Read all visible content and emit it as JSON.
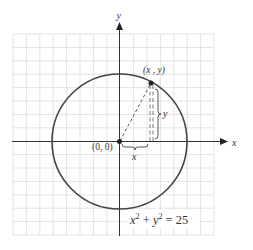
{
  "figure": {
    "axes": {
      "x_label": "x",
      "y_label": "y"
    },
    "origin_label": "(0, 0)",
    "point_label": "(x , y)",
    "horizontal_leg_label": "x",
    "vertical_leg_label": "y",
    "equation": {
      "base_x": "x",
      "exp_x": "2",
      "plus": " + ",
      "base_y": "y",
      "exp_y": "2",
      "rhs": " = 25"
    },
    "circle_radius": 5,
    "grid": {
      "columns": 15,
      "rows": 15
    },
    "colors": {
      "grid": "#d9d9d9",
      "axes": "#333333",
      "circle": "#444444"
    }
  }
}
